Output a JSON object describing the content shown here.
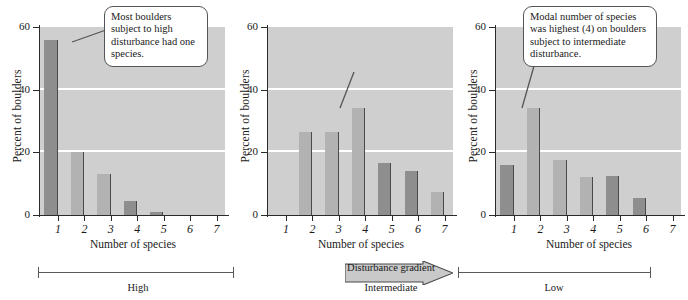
{
  "figure": {
    "axis": {
      "ylabel": "Percent of boulders",
      "xlabel": "Number of species",
      "yticks": [
        "0",
        "20",
        "40",
        "60"
      ],
      "xticks": [
        "1",
        "2",
        "3",
        "4",
        "5",
        "6",
        "7"
      ],
      "ylim": [
        0,
        60
      ],
      "gridlines": [
        20,
        40
      ],
      "plot_bg": "#cfcfcf",
      "gridline_color": "#ffffff",
      "bar_dark": "#8e8e8e",
      "bar_light": "#b2b2b2"
    },
    "callouts": {
      "panel1": "Most boulders subject to high disturbance had one species.",
      "panel2": "Modal number of species was highest (4) on boulders subject to intermediate disturbance.",
      "panel3": "Modal number of species on boulders subject to low disturbance was two."
    },
    "gradient": {
      "arrow_label": "Disturbance gradient",
      "left_label": "High",
      "middle_label": "Intermediate",
      "right_label": "Low"
    }
  },
  "chart_data": [
    {
      "type": "bar",
      "title": "High disturbance",
      "categories": [
        "1",
        "2",
        "3",
        "4",
        "5",
        "6",
        "7"
      ],
      "values": [
        56,
        20,
        13,
        4.5,
        1,
        0,
        0
      ],
      "shades": [
        "dark",
        "light",
        "light",
        "dark",
        "dark",
        "light",
        "light"
      ],
      "xlabel": "Number of species",
      "ylabel": "Percent of boulders",
      "ylim": [
        0,
        60
      ],
      "yticks": [
        0,
        20,
        40,
        60
      ],
      "grid": true,
      "annotation": "Most boulders subject to high disturbance had one species."
    },
    {
      "type": "bar",
      "title": "Intermediate disturbance",
      "categories": [
        "1",
        "2",
        "3",
        "4",
        "5",
        "6",
        "7"
      ],
      "values": [
        0,
        26.5,
        26.5,
        34,
        16.5,
        14,
        7.5
      ],
      "shades": [
        "light",
        "light",
        "light",
        "light",
        "dark",
        "dark",
        "light"
      ],
      "xlabel": "Number of species",
      "ylabel": "Percent of boulders",
      "ylim": [
        0,
        60
      ],
      "yticks": [
        0,
        20,
        40,
        60
      ],
      "grid": true,
      "annotation": "Modal number of species was highest (4) on boulders subject to intermediate disturbance."
    },
    {
      "type": "bar",
      "title": "Low disturbance",
      "categories": [
        "1",
        "2",
        "3",
        "4",
        "5",
        "6",
        "7"
      ],
      "values": [
        16,
        34,
        17.5,
        12,
        12.5,
        5.5,
        0
      ],
      "shades": [
        "dark",
        "light",
        "light",
        "light",
        "dark",
        "dark",
        "light"
      ],
      "xlabel": "Number of species",
      "ylabel": "Percent of boulders",
      "ylim": [
        0,
        60
      ],
      "yticks": [
        0,
        20,
        40,
        60
      ],
      "grid": true,
      "annotation": "Modal number of species on boulders subject to low disturbance was two."
    }
  ]
}
